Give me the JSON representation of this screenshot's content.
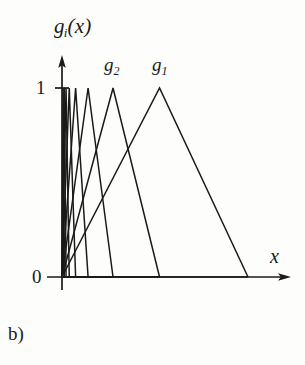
{
  "figure": {
    "caption": "b)",
    "background_color": "#fdfdfc",
    "ink_color": "#1a1a18"
  },
  "axes": {
    "y_label": "g",
    "y_label_sub": "i",
    "y_label_arg": "(x)",
    "x_label": "x",
    "y_ticks": [
      "1",
      "0"
    ],
    "x_ticks": []
  },
  "annotations": [
    {
      "name": "g2",
      "base": "g",
      "sub": "2"
    },
    {
      "name": "g1",
      "base": "g",
      "sub": "1"
    }
  ],
  "chart_data": {
    "type": "line",
    "title": "",
    "subtitle": "",
    "xlabel": "x",
    "ylabel": "g_i(x)",
    "grid": false,
    "legend_position": "inline-above-peaks",
    "xlim": [
      0,
      1.0
    ],
    "ylim": [
      0,
      1.0
    ],
    "ytick_labels": [
      "0",
      "1"
    ],
    "ytick_values": [
      0,
      1
    ],
    "series": [
      {
        "name": "g1",
        "label": "g_1",
        "labeled": true,
        "peak_x": 0.43,
        "peak_y": 1.0,
        "left_x": 0.0,
        "right_x": 0.82,
        "points_x": [
          0.0,
          0.43,
          0.82
        ],
        "points_y": [
          0.0,
          1.0,
          0.0
        ]
      },
      {
        "name": "g2",
        "label": "g_2",
        "labeled": true,
        "peak_x": 0.225,
        "peak_y": 1.0,
        "left_x": 0.0,
        "right_x": 0.43,
        "points_x": [
          0.0,
          0.225,
          0.43
        ],
        "points_y": [
          0.0,
          1.0,
          0.0
        ]
      },
      {
        "name": "g3",
        "label": "g_3",
        "labeled": false,
        "peak_x": 0.115,
        "peak_y": 1.0,
        "left_x": 0.0,
        "right_x": 0.225,
        "points_x": [
          0.0,
          0.115,
          0.225
        ],
        "points_y": [
          0.0,
          1.0,
          0.0
        ]
      },
      {
        "name": "g4",
        "label": "g_4",
        "labeled": false,
        "peak_x": 0.06,
        "peak_y": 1.0,
        "left_x": 0.0,
        "right_x": 0.115,
        "points_x": [
          0.0,
          0.06,
          0.115
        ],
        "points_y": [
          0.0,
          1.0,
          0.0
        ]
      },
      {
        "name": "g5",
        "label": "g_5",
        "labeled": false,
        "peak_x": 0.032,
        "peak_y": 1.0,
        "left_x": 0.0,
        "right_x": 0.06,
        "points_x": [
          0.0,
          0.032,
          0.06
        ],
        "points_y": [
          0.0,
          1.0,
          0.0
        ]
      },
      {
        "name": "g6",
        "label": "g_6",
        "labeled": false,
        "peak_x": 0.018,
        "peak_y": 1.0,
        "left_x": 0.0,
        "right_x": 0.032,
        "points_x": [
          0.0,
          0.018,
          0.032
        ],
        "points_y": [
          0.0,
          1.0,
          0.0
        ]
      },
      {
        "name": "g7",
        "label": "g_7",
        "labeled": false,
        "peak_x": 0.01,
        "peak_y": 1.0,
        "left_x": 0.0,
        "right_x": 0.018,
        "points_x": [
          0.0,
          0.01,
          0.018
        ],
        "points_y": [
          0.0,
          1.0,
          0.0
        ]
      },
      {
        "name": "g8",
        "label": "g_8",
        "labeled": false,
        "peak_x": 0.005,
        "peak_y": 1.0,
        "left_x": 0.0,
        "right_x": 0.01,
        "points_x": [
          0.0,
          0.005,
          0.01
        ],
        "points_y": [
          0.0,
          1.0,
          0.0
        ]
      }
    ]
  }
}
